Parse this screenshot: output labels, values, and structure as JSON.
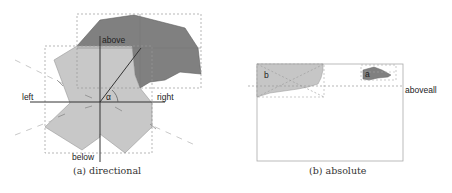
{
  "figure": {
    "panels": [
      {
        "id": "a",
        "caption": "(a) directional",
        "labels": {
          "above": "above",
          "below": "below",
          "left": "left",
          "right": "right",
          "angle": "α"
        },
        "shapes": [
          {
            "name": "reference-polygon",
            "fill": "#c6c6c6"
          },
          {
            "name": "target-polygon",
            "fill": "#7f7f7f"
          }
        ]
      },
      {
        "id": "b",
        "caption": "(b) absolute",
        "labels": {
          "b": "b",
          "a": "a",
          "aboveall": "aboveall"
        },
        "shapes": [
          {
            "name": "polygon-b",
            "fill": "#c6c6c6"
          },
          {
            "name": "polygon-a",
            "fill": "#7f7f7f"
          }
        ]
      }
    ]
  },
  "colors": {
    "light_shape": "#c6c6c6",
    "dark_shape": "#7f7f7f",
    "axis": "#333333",
    "dashed": "#aaaaaa"
  }
}
